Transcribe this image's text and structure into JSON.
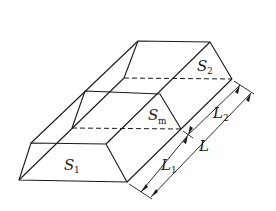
{
  "diagram": {
    "type": "prismatoid-volume-figure",
    "labels": {
      "s1": {
        "main": "S",
        "sub": "1"
      },
      "s2": {
        "main": "S",
        "sub": "2"
      },
      "sm": {
        "main": "S",
        "sub": "m"
      },
      "l": {
        "main": "L"
      },
      "l1": {
        "main": "L",
        "sub": "1"
      },
      "l2": {
        "main": "L",
        "sub": "2"
      }
    },
    "colors": {
      "line": "#1a1a1a",
      "background": "#ffffff"
    }
  }
}
